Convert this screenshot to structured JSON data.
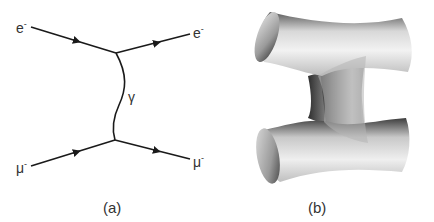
{
  "figure": {
    "panel_a": {
      "caption": "(a)",
      "particles": {
        "top_left": "e",
        "top_right": "e",
        "bottom_left": "μ",
        "bottom_right": "μ",
        "charge": "-"
      },
      "propagator": "γ"
    },
    "panel_b": {
      "caption": "(b)"
    },
    "colors": {
      "line": "#1a1a1a",
      "label": "#333333",
      "surface_light": "#f0f0f0",
      "surface_dark": "#4a4a4a"
    }
  }
}
